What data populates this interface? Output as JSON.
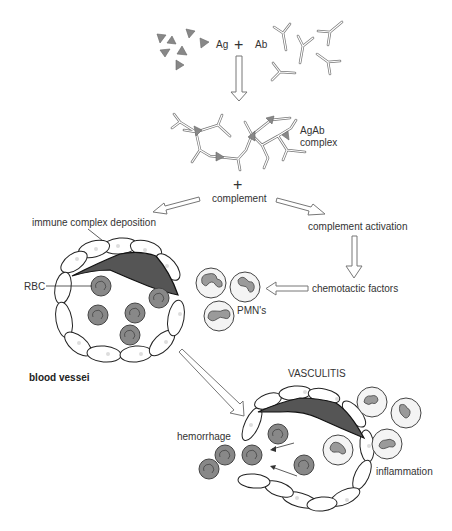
{
  "diagram": {
    "top": {
      "antigen_label": "Ag",
      "plus_symbol": "+",
      "antibody_label": "Ab"
    },
    "complex": {
      "label_line1": "AgAb",
      "label_line2": "complex"
    },
    "complement": {
      "plus_symbol": "+",
      "label": "complement"
    },
    "left_branch": {
      "deposition_label": "immune complex deposition",
      "rbc_label": "RBC",
      "vessel_label": "blood vessei"
    },
    "right_branch": {
      "activation_label": "complement activation",
      "chemotactic_label": "chemotactic factors",
      "pmn_label": "PMN's"
    },
    "outcome": {
      "title": "VASCULITIS",
      "hemorrhage_label": "hemorrhage",
      "inflammation_label": "inflammation"
    },
    "colors": {
      "deposit": "#555555",
      "rbc": "#888888",
      "arrow_outline": "#777777",
      "background": "#ffffff"
    }
  }
}
